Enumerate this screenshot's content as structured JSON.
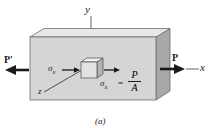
{
  "figure": {
    "caption": "(a)",
    "axes": {
      "y": "y",
      "x": "x",
      "z": "z"
    },
    "forces": {
      "left": "P'",
      "right": "P"
    },
    "stress": {
      "left_label": "σ",
      "left_sub": "x",
      "right_label": "σ",
      "right_sub": "x",
      "equals": "=",
      "numerator": "P",
      "denominator": "A"
    },
    "colors": {
      "front_face": "#d5d5d5",
      "top_face": "#e8e8e8",
      "side_face": "#a8a8a8",
      "cube_front": "#e2e2e2",
      "cube_top": "#f0f0f0",
      "cube_side": "#b4b4b4",
      "outline": "#6b6b6b",
      "ink": "#1a1a1a",
      "background": "#ffffff"
    }
  }
}
